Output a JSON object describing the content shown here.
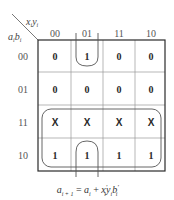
{
  "kmap": {
    "column_variable": "x_i y_i",
    "row_variable": "a_i b_i",
    "column_labels": [
      "00",
      "01",
      "11",
      "10"
    ],
    "row_labels": [
      "00",
      "01",
      "11",
      "10"
    ],
    "cells": [
      [
        "0",
        "1",
        "0",
        "0"
      ],
      [
        "0",
        "0",
        "0",
        "0"
      ],
      [
        "X",
        "X",
        "X",
        "X"
      ],
      [
        "1",
        "1",
        "1",
        "1"
      ]
    ],
    "groups": [
      {
        "name": "rows-11-10-group",
        "covers": "rows 11 and 10, all columns",
        "term": "a_i"
      },
      {
        "name": "column-01-wrap-group",
        "covers": "column 01, rows 00 and 10 (wrap-around)",
        "term": "x'_i y_i b'_i"
      }
    ]
  },
  "formula": {
    "lhs": "a",
    "lhs_sub": "i + 1",
    "eq": " = ",
    "t1": "a",
    "t1_sub": "i",
    "plus": " + ",
    "t2a": "x",
    "t2a_sup": "′",
    "t2a_sub": "i",
    "t2b": "y",
    "t2b_sub": "i",
    "t2c": "b",
    "t2c_sup": "′",
    "t2c_sub": "i",
    "text": "a_{i+1} = a_i + x'_i y_i b'_i"
  },
  "colors": {
    "grid": "#2a2a2a",
    "inner_grid": "#999999",
    "group_outline": "#555555"
  }
}
